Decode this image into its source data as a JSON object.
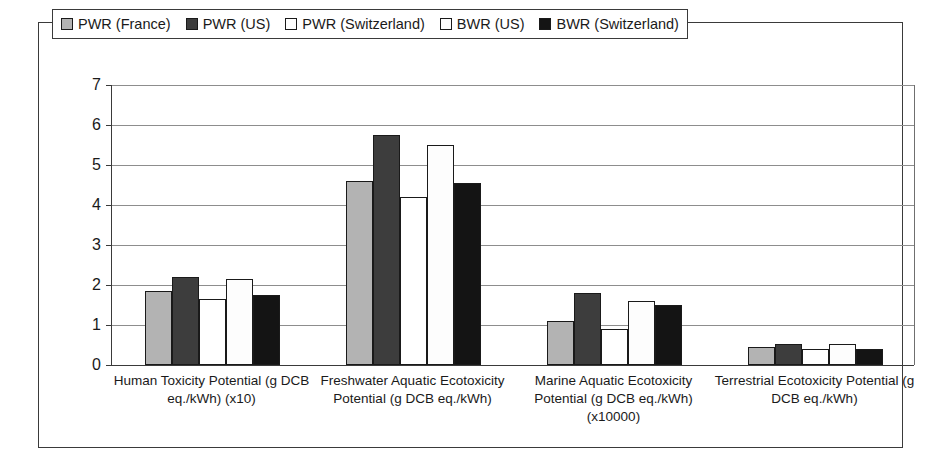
{
  "chart_data": {
    "type": "bar",
    "title": "",
    "subtitle": "",
    "xlabel": "",
    "ylabel": "",
    "ylim": [
      0,
      7
    ],
    "yticks": [
      "0",
      "1",
      "2",
      "3",
      "4",
      "5",
      "6",
      "7"
    ],
    "grid": true,
    "legend_position": "top-center",
    "categories": [
      "Human Toxicity Potential (g DCB eq./kWh) (x10)",
      "Freshwater Aquatic Ecotoxicity Potential (g DCB eq./kWh)",
      "Marine Aquatic Ecotoxicity Potential (g DCB eq./kWh) (x10000)",
      "Terrestrial Ecotoxicity Potential (g DCB eq./kWh)"
    ],
    "series": [
      {
        "name": "PWR (France)",
        "swatch": "light-gray",
        "color": "#b3b3b3",
        "values": [
          1.85,
          4.6,
          1.1,
          0.45
        ]
      },
      {
        "name": "PWR (US)",
        "swatch": "dark-gray",
        "color": "#3d3d3d",
        "values": [
          2.2,
          5.75,
          1.8,
          0.52
        ]
      },
      {
        "name": "PWR (Switzerland)",
        "swatch": "white",
        "color": "#ffffff",
        "values": [
          1.65,
          4.2,
          0.9,
          0.4
        ]
      },
      {
        "name": "BWR (US)",
        "swatch": "white",
        "color": "#fdfdfd",
        "values": [
          2.15,
          5.5,
          1.6,
          0.53
        ]
      },
      {
        "name": "BWR (Switzerland)",
        "swatch": "black",
        "color": "#141414",
        "values": [
          1.75,
          4.55,
          1.5,
          0.4
        ]
      }
    ]
  }
}
